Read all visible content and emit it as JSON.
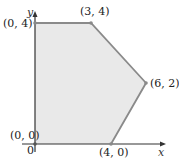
{
  "diagram": {
    "type": "feasible-region",
    "axes": {
      "x_label": "x",
      "y_label": "y",
      "origin_label": "0"
    },
    "colors": {
      "region_fill": "#e9e9e9",
      "edge": "#8a8a8a",
      "axis": "#333333",
      "vertex": "#8a8a8a"
    },
    "vertices": [
      {
        "label": "(0, 0)",
        "x": 0,
        "y": 0
      },
      {
        "label": "(0, 4)",
        "x": 0,
        "y": 4
      },
      {
        "label": "(3, 4)",
        "x": 3,
        "y": 4
      },
      {
        "label": "(6, 2)",
        "x": 6,
        "y": 2
      },
      {
        "label": "(4, 0)",
        "x": 4,
        "y": 0
      }
    ]
  }
}
